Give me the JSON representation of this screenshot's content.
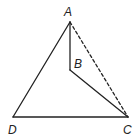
{
  "diagram": {
    "type": "geometry",
    "points": {
      "A": {
        "label": "A",
        "x": 70,
        "y": 22,
        "lx": 64,
        "ly": 16
      },
      "B": {
        "label": "B",
        "x": 70,
        "y": 70,
        "lx": 74,
        "ly": 66
      },
      "C": {
        "label": "C",
        "x": 128,
        "y": 117,
        "lx": 123,
        "ly": 133
      },
      "D": {
        "label": "D",
        "x": 13,
        "y": 117,
        "lx": 8,
        "ly": 133
      }
    },
    "segments": [
      {
        "from": "A",
        "to": "D",
        "style": "solid"
      },
      {
        "from": "D",
        "to": "C",
        "style": "solid"
      },
      {
        "from": "A",
        "to": "B",
        "style": "solid"
      },
      {
        "from": "B",
        "to": "C",
        "style": "solid"
      },
      {
        "from": "A",
        "to": "C",
        "style": "dashed"
      }
    ],
    "stroke_color": "#222222"
  }
}
